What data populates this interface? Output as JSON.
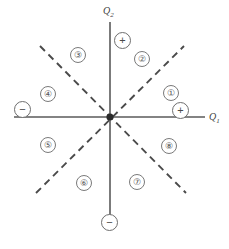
{
  "figure": {
    "background_color": "#ffffff",
    "axis_color": "#5a5a5a",
    "dashed_color": "#4a4a4a",
    "circle_stroke_color": "#7a7a7a",
    "text_color": "#555555"
  },
  "axes": [
    {
      "id": "q1",
      "label": "Q",
      "subscript": "1",
      "orientation": "horizontal",
      "label_x": 209,
      "label_y": 112,
      "x1": 14,
      "y1": 117,
      "x2": 205,
      "y2": 117
    },
    {
      "id": "q2",
      "label": "Q",
      "subscript": "2",
      "orientation": "vertical",
      "label_x": 103,
      "label_y": 6,
      "x1": 110,
      "y1": 22,
      "x2": 110,
      "y2": 218
    }
  ],
  "dashed_lines": [
    {
      "id": "diagonal-nw-se",
      "x1": 40,
      "y1": 46,
      "x2": 186,
      "y2": 193
    },
    {
      "id": "diagonal-sw-ne",
      "x1": 36,
      "y1": 193,
      "x2": 184,
      "y2": 46
    }
  ],
  "origin": {
    "x": 110,
    "y": 117,
    "marker": "star-point"
  },
  "regions": [
    {
      "id": "region-1",
      "label": "①",
      "number": 1,
      "x": 163,
      "y": 93
    },
    {
      "id": "region-2",
      "label": "②",
      "number": 2,
      "x": 134,
      "y": 59
    },
    {
      "id": "region-3",
      "label": "③",
      "number": 3,
      "x": 79,
      "y": 55
    },
    {
      "id": "region-4",
      "label": "④",
      "number": 4,
      "x": 48,
      "y": 94
    },
    {
      "id": "region-5",
      "label": "⑤",
      "number": 5,
      "x": 48,
      "y": 145
    },
    {
      "id": "region-6",
      "label": "⑥",
      "number": 6,
      "x": 84,
      "y": 183
    },
    {
      "id": "region-7",
      "label": "⑦",
      "number": 7,
      "x": 137,
      "y": 182
    },
    {
      "id": "region-8",
      "label": "⑧",
      "number": 8,
      "x": 169,
      "y": 146
    }
  ],
  "sign_markers": [
    {
      "id": "sign-q1-positive",
      "symbol": "+",
      "axis": "q1",
      "sense": "positive",
      "x": 172,
      "y": 102
    },
    {
      "id": "sign-q1-negative",
      "symbol": "−",
      "axis": "q1",
      "sense": "negative",
      "x": 14,
      "y": 101
    },
    {
      "id": "sign-q2-positive",
      "symbol": "+",
      "axis": "q2",
      "sense": "positive",
      "x": 114,
      "y": 32
    },
    {
      "id": "sign-q2-negative",
      "symbol": "−",
      "axis": "q2",
      "sense": "negative",
      "x": 101,
      "y": 214
    }
  ]
}
